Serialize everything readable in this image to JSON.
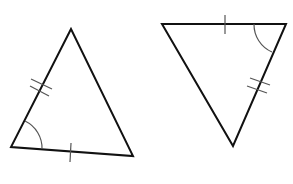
{
  "figure": {
    "background": "#ffffff",
    "stroke_color": "#111111",
    "mark_color": "#555555"
  },
  "triangles": [
    {
      "name": "left-triangle",
      "vertices": [
        [
          71,
          29
        ],
        [
          11,
          147
        ],
        [
          133,
          156
        ]
      ],
      "marks": {
        "single_tick_side": "bottom",
        "double_tick_side": "left",
        "angle_arc_vertex": "bottom-left"
      }
    },
    {
      "name": "right-triangle",
      "vertices": [
        [
          162,
          24
        ],
        [
          286,
          24
        ],
        [
          233,
          146
        ]
      ],
      "marks": {
        "single_tick_side": "top",
        "double_tick_side": "right",
        "angle_arc_vertex": "top-right"
      }
    }
  ]
}
